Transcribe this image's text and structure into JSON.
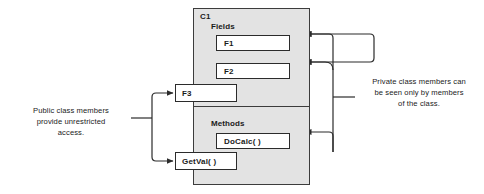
{
  "diagram": {
    "type": "class-encapsulation-diagram",
    "class_box": {
      "name": "C1",
      "sections": [
        {
          "label": "Fields",
          "members": [
            "F1",
            "F2"
          ]
        },
        {
          "label": "Methods",
          "members": [
            "DoCalc( )"
          ]
        }
      ],
      "public_members": [
        "F3",
        "GetVal( )"
      ]
    },
    "annotations": {
      "left": {
        "lines": [
          "Public class members",
          "provide unrestricted",
          "access."
        ],
        "targets": [
          "F3",
          "GetVal( )"
        ]
      },
      "right": {
        "lines": [
          "Private class members can",
          "be seen only by members",
          "of the class."
        ],
        "targets": [
          "F1",
          "F2",
          "DoCalc( )"
        ]
      }
    },
    "colors": {
      "class_fill": "#e3e3e3",
      "member_fill": "#ffffff",
      "stroke": "#2b2b2b",
      "text": "#1a1a1a",
      "background": "#ffffff"
    }
  }
}
